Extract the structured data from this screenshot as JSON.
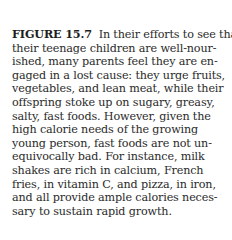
{
  "figure": {
    "label": "FIGURE 15.7",
    "lines": [
      "In their efforts to see that",
      "their teenage children are well-nour-",
      "ished, many parents feel they are en-",
      "gaged in a lost cause: they urge fruits,",
      "vegetables, and lean meat, while their",
      "offspring stoke up on sugary, greasy,",
      "salty, fast foods.  However, given the",
      "high calorie needs of the growing",
      "young person, fast foods are not un-",
      "equivocally bad.  For instance, milk",
      "shakes are rich in calcium, French",
      "fries, in vitamin C, and pizza, in iron,",
      "and all provide ample calories neces-",
      "sary to sustain rapid growth."
    ]
  }
}
